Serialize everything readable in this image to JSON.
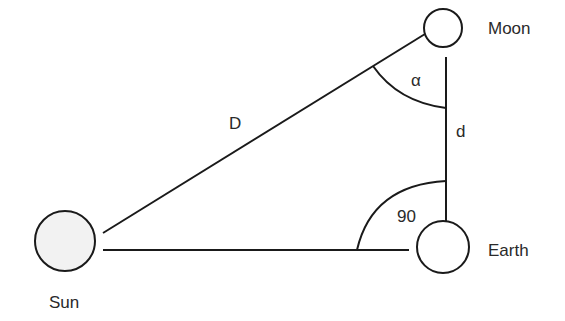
{
  "diagram": {
    "colors": {
      "stroke": "#1a1a1a",
      "sun_fill": "#f2f2f2",
      "body_fill": "#ffffff",
      "text": "#2a2a2a"
    },
    "bodies": {
      "sun": {
        "label": "Sun"
      },
      "earth": {
        "label": "Earth"
      },
      "moon": {
        "label": "Moon"
      }
    },
    "sides": {
      "sun_moon": {
        "label": "D"
      },
      "earth_moon": {
        "label": "d"
      }
    },
    "angles": {
      "at_moon": {
        "label": "α"
      },
      "at_earth": {
        "label": "90"
      }
    }
  }
}
